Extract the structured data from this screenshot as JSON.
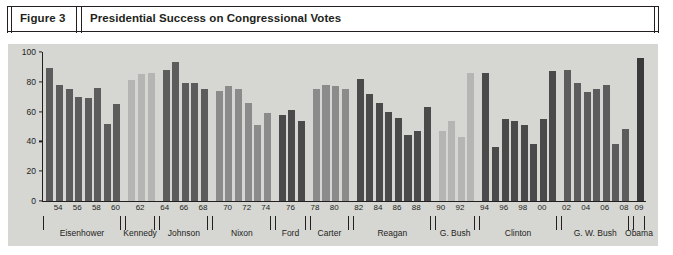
{
  "header": {
    "figure_number": "Figure 3",
    "title": "Presidential Success on Congressional Votes"
  },
  "chart_data": {
    "type": "bar",
    "title": "Presidential Success on Congressional Votes",
    "xlabel": "",
    "ylabel": "",
    "ylim": [
      0,
      100
    ],
    "yticks": [
      0,
      20,
      40,
      60,
      80,
      100
    ],
    "grid": false,
    "legend": false,
    "xtick_labels": [
      "54",
      "56",
      "58",
      "60",
      "62",
      "64",
      "66",
      "68",
      "70",
      "72",
      "74",
      "76",
      "78",
      "80",
      "82",
      "84",
      "86",
      "88",
      "90",
      "92",
      "94",
      "96",
      "98",
      "00",
      "02",
      "04",
      "06",
      "08",
      "09"
    ],
    "categories": [
      "53",
      "54",
      "55",
      "56",
      "57",
      "58",
      "59",
      "60",
      "61",
      "62",
      "63",
      "64",
      "65",
      "66",
      "67",
      "68",
      "69",
      "70",
      "71",
      "72",
      "73",
      "74",
      "75",
      "76",
      "77",
      "78",
      "79",
      "80",
      "81",
      "82",
      "83",
      "84",
      "85",
      "86",
      "87",
      "88",
      "89",
      "90",
      "91",
      "92",
      "93",
      "94",
      "95",
      "96",
      "97",
      "98",
      "99",
      "00",
      "01",
      "02",
      "03",
      "04",
      "05",
      "06",
      "07",
      "08",
      "09"
    ],
    "values": [
      89,
      78,
      75,
      70,
      69,
      76,
      52,
      65,
      81,
      85,
      86,
      88,
      93,
      79,
      79,
      75,
      74,
      77,
      75,
      66,
      51,
      59,
      58,
      61,
      54,
      75,
      78,
      77,
      75,
      82,
      72,
      66,
      60,
      56,
      44,
      47,
      63,
      47,
      54,
      43,
      86,
      86,
      36,
      55,
      54,
      51,
      38,
      55,
      87,
      88,
      79,
      73,
      75,
      78,
      38,
      48,
      96
    ],
    "groups": [
      {
        "president": "Eisenhower",
        "years": [
          "53",
          "54",
          "55",
          "56",
          "57",
          "58",
          "59",
          "60"
        ],
        "values": [
          89,
          78,
          75,
          70,
          69,
          76,
          52,
          65
        ],
        "color": "#5c5c5c"
      },
      {
        "president": "Kennedy",
        "years": [
          "61",
          "62",
          "63"
        ],
        "values": [
          81,
          85,
          86
        ],
        "color": "#b5b5b3"
      },
      {
        "president": "Johnson",
        "years": [
          "64",
          "65",
          "66",
          "67",
          "68"
        ],
        "values": [
          88,
          93,
          79,
          79,
          75
        ],
        "color": "#5c5c5c"
      },
      {
        "president": "Nixon",
        "years": [
          "69",
          "70",
          "71",
          "72",
          "73",
          "74"
        ],
        "values": [
          74,
          77,
          75,
          66,
          51,
          59
        ],
        "color": "#8b8b8b"
      },
      {
        "president": "Ford",
        "years": [
          "75",
          "76",
          "77"
        ],
        "values": [
          58,
          61,
          54
        ],
        "color": "#4a4a4a"
      },
      {
        "president": "Carter",
        "years": [
          "78",
          "79",
          "80",
          "81"
        ],
        "values": [
          75,
          78,
          77,
          75
        ],
        "color": "#8b8b8b"
      },
      {
        "president": "Reagan",
        "years": [
          "82",
          "83",
          "84",
          "85",
          "86",
          "87",
          "88",
          "89"
        ],
        "values": [
          82,
          72,
          66,
          60,
          56,
          44,
          47,
          63
        ],
        "color": "#4a4a4a"
      },
      {
        "president": "G. Bush",
        "years": [
          "90",
          "91",
          "92",
          "93"
        ],
        "values": [
          47,
          54,
          43,
          86
        ],
        "color": "#b5b5b3"
      },
      {
        "president": "Clinton",
        "years": [
          "94",
          "95",
          "96",
          "97",
          "98",
          "99",
          "00",
          "01"
        ],
        "values": [
          86,
          36,
          55,
          54,
          51,
          38,
          55,
          87
        ],
        "color": "#4a4a4a"
      },
      {
        "president": "G. W. Bush",
        "years": [
          "02",
          "03",
          "04",
          "05",
          "06",
          "07",
          "08"
        ],
        "values": [
          88,
          79,
          73,
          75,
          78,
          38,
          48
        ],
        "color": "#5c5c5c"
      },
      {
        "president": "Obama",
        "years": [
          "09"
        ],
        "values": [
          96
        ],
        "color": "#3a3a3a"
      }
    ],
    "bar_series": [
      {
        "group": "Eisenhower",
        "value": 89,
        "color": "#5c5c5c"
      },
      {
        "group": "Eisenhower",
        "value": 78,
        "color": "#5c5c5c"
      },
      {
        "group": "Eisenhower",
        "value": 75,
        "color": "#5c5c5c"
      },
      {
        "group": "Eisenhower",
        "value": 70,
        "color": "#5c5c5c"
      },
      {
        "group": "Eisenhower",
        "value": 69,
        "color": "#5c5c5c"
      },
      {
        "group": "Eisenhower",
        "value": 76,
        "color": "#5c5c5c"
      },
      {
        "group": "Eisenhower",
        "value": 52,
        "color": "#5c5c5c"
      },
      {
        "group": "Eisenhower",
        "value": 65,
        "color": "#5c5c5c"
      },
      {
        "group": "Kennedy",
        "value": 81,
        "color": "#b5b5b3"
      },
      {
        "group": "Kennedy",
        "value": 85,
        "color": "#b5b5b3"
      },
      {
        "group": "Kennedy",
        "value": 86,
        "color": "#b5b5b3"
      },
      {
        "group": "Johnson",
        "value": 88,
        "color": "#5c5c5c"
      },
      {
        "group": "Johnson",
        "value": 93,
        "color": "#5c5c5c"
      },
      {
        "group": "Johnson",
        "value": 79,
        "color": "#5c5c5c"
      },
      {
        "group": "Johnson",
        "value": 79,
        "color": "#5c5c5c"
      },
      {
        "group": "Johnson",
        "value": 75,
        "color": "#5c5c5c"
      },
      {
        "group": "Nixon",
        "value": 74,
        "color": "#8b8b8b"
      },
      {
        "group": "Nixon",
        "value": 77,
        "color": "#8b8b8b"
      },
      {
        "group": "Nixon",
        "value": 75,
        "color": "#8b8b8b"
      },
      {
        "group": "Nixon",
        "value": 66,
        "color": "#8b8b8b"
      },
      {
        "group": "Nixon",
        "value": 51,
        "color": "#8b8b8b"
      },
      {
        "group": "Nixon",
        "value": 59,
        "color": "#8b8b8b"
      },
      {
        "group": "Ford",
        "value": 58,
        "color": "#4a4a4a"
      },
      {
        "group": "Ford",
        "value": 61,
        "color": "#4a4a4a"
      },
      {
        "group": "Ford",
        "value": 54,
        "color": "#4a4a4a"
      },
      {
        "group": "Carter",
        "value": 75,
        "color": "#8b8b8b"
      },
      {
        "group": "Carter",
        "value": 78,
        "color": "#8b8b8b"
      },
      {
        "group": "Carter",
        "value": 77,
        "color": "#8b8b8b"
      },
      {
        "group": "Carter",
        "value": 75,
        "color": "#8b8b8b"
      },
      {
        "group": "Reagan",
        "value": 82,
        "color": "#4a4a4a"
      },
      {
        "group": "Reagan",
        "value": 72,
        "color": "#4a4a4a"
      },
      {
        "group": "Reagan",
        "value": 66,
        "color": "#4a4a4a"
      },
      {
        "group": "Reagan",
        "value": 60,
        "color": "#4a4a4a"
      },
      {
        "group": "Reagan",
        "value": 56,
        "color": "#4a4a4a"
      },
      {
        "group": "Reagan",
        "value": 44,
        "color": "#4a4a4a"
      },
      {
        "group": "Reagan",
        "value": 47,
        "color": "#4a4a4a"
      },
      {
        "group": "G. Bush",
        "value": 63,
        "color": "#b5b5b3"
      },
      {
        "group": "G. Bush",
        "value": 47,
        "color": "#b5b5b3"
      },
      {
        "group": "G. Bush",
        "value": 54,
        "color": "#b5b5b3"
      },
      {
        "group": "G. Bush",
        "value": 43,
        "color": "#b5b5b3"
      },
      {
        "group": "Clinton",
        "value": 86,
        "color": "#4a4a4a"
      },
      {
        "group": "Clinton",
        "value": 86,
        "color": "#4a4a4a"
      },
      {
        "group": "Clinton",
        "value": 36,
        "color": "#4a4a4a"
      },
      {
        "group": "Clinton",
        "value": 55,
        "color": "#4a4a4a"
      },
      {
        "group": "Clinton",
        "value": 54,
        "color": "#4a4a4a"
      },
      {
        "group": "Clinton",
        "value": 51,
        "color": "#4a4a4a"
      },
      {
        "group": "Clinton",
        "value": 38,
        "color": "#4a4a4a"
      },
      {
        "group": "Clinton",
        "value": 55,
        "color": "#4a4a4a"
      },
      {
        "group": "G. W. Bush",
        "value": 87,
        "color": "#5c5c5c"
      },
      {
        "group": "G. W. Bush",
        "value": 88,
        "color": "#5c5c5c"
      },
      {
        "group": "G. W. Bush",
        "value": 79,
        "color": "#5c5c5c"
      },
      {
        "group": "G. W. Bush",
        "value": 73,
        "color": "#5c5c5c"
      },
      {
        "group": "G. W. Bush",
        "value": 75,
        "color": "#5c5c5c"
      },
      {
        "group": "G. W. Bush",
        "value": 78,
        "color": "#5c5c5c"
      },
      {
        "group": "G. W. Bush",
        "value": 38,
        "color": "#5c5c5c"
      },
      {
        "group": "G. W. Bush",
        "value": 48,
        "color": "#5c5c5c"
      },
      {
        "group": "Obama",
        "value": 96,
        "color": "#3a3a3a"
      }
    ],
    "president_labels": [
      "Eisenhower",
      "Kennedy",
      "Johnson",
      "Nixon",
      "Ford",
      "Carter",
      "Reagan",
      "G. Bush",
      "Clinton",
      "G. W. Bush",
      "Obama"
    ],
    "colors": {
      "plot_background": "#d6d6d3",
      "axis": "#231f20",
      "dark_bar": "#4a4a4a",
      "medium_bar": "#8b8b8b",
      "light_bar": "#b5b5b3"
    }
  }
}
